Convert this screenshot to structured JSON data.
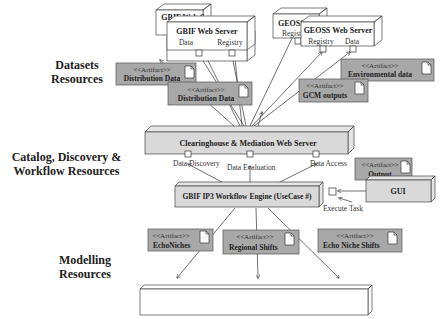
{
  "sections": {
    "datasets": "Datasets Resources",
    "catalog_line1": "Catalog, Discovery &",
    "catalog_line2": "Workflow Resources",
    "modelling_line1": "Modelling",
    "modelling_line2": "Resources"
  },
  "nodes": {
    "gbif_back": {
      "title": "GBIF Web Server",
      "ports": [
        "Registry",
        "Data"
      ]
    },
    "gbif_front": {
      "title": "GBIF Web Server",
      "ports": [
        "Data",
        "Registry"
      ]
    },
    "geoss_back": {
      "title": "GEOSS Web Server",
      "ports": [
        "Registry"
      ]
    },
    "geoss_front": {
      "title": "GEOSS Web Server",
      "ports": [
        "Registry",
        "Data"
      ]
    },
    "clearinghouse": {
      "title": "Clearinghouse & Mediation Web Server",
      "ports": [
        "Data Discovery",
        "Data Evaluation",
        "Data Access"
      ]
    },
    "workflow": {
      "title": "GBIF IP3 Workflow Engine (UseCase #)",
      "port": "Execute Task"
    },
    "gui": {
      "title": "GUI"
    },
    "biodiversity": {
      "title": "Biodiversity Model Web Server",
      "ports": [
        "Run GARP Model",
        "Run Regional Shift Model",
        "Run Distribution Shift Model"
      ]
    }
  },
  "artifacts": {
    "stereotype": "<<Artifact>>",
    "dist1": "Distribution Data",
    "dist2": "Distribution Data",
    "env": "Environmental data",
    "gcm": "GCM outputs",
    "output": "Output",
    "echo": "EchoNiches",
    "regional": "Regional Shifts",
    "echoshift": "Echo Niche Shifts"
  },
  "colors": {
    "artifact_fill": "#a8a8a8",
    "node_fill": "#d9d9d9",
    "server_fill": "#ffffff",
    "line": "#333333"
  }
}
